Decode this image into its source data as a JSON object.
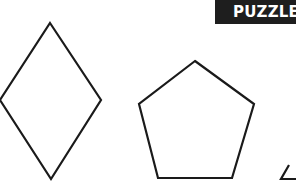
{
  "badge": {
    "label": "PUZZLE",
    "background": "#1e1e1e",
    "color": "#ffffff"
  },
  "shapes": [
    {
      "name": "diamond",
      "sides": 4
    },
    {
      "name": "pentagon",
      "sides": 5
    },
    {
      "name": "triangle",
      "sides": 3,
      "partial": true
    }
  ],
  "stroke_color": "#1a1a1a"
}
